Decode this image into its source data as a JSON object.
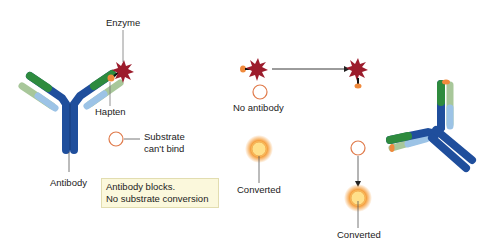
{
  "labels": {
    "enzyme": "Enzyme",
    "hapten": "Hapten",
    "substrate_cant_bind_1": "Substrate",
    "substrate_cant_bind_2": "can't bind",
    "antibody": "Antibody",
    "note_line1": "Antibody blocks.",
    "note_line2": "No substrate conversion",
    "no_antibody": "No antibody",
    "converted_middle": "Converted",
    "converted_right": "Converted"
  },
  "colors": {
    "heavy_chain": "#1f4e9c",
    "heavy_chain_dark": "#173a78",
    "variable_green": "#2e8b3e",
    "light_chain_green": "#a8c79a",
    "light_chain_blue": "#9cc3e6",
    "enzyme": "#9c1c2c",
    "hapten": "#f08a3c",
    "substrate_ring": "#e07a4a",
    "converted_glow": "#f5a040",
    "note_bg": "#fbf8dc"
  }
}
